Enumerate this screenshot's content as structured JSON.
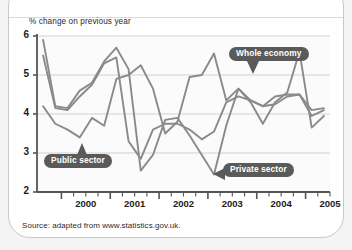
{
  "figure": {
    "axis_caption": "% change on previous year",
    "source_note": "Source: adapted from www.statistics.gov.uk.",
    "callouts": {
      "whole_economy": "Whole economy",
      "public_sector": "Public sector",
      "private_sector": "Private sector"
    }
  },
  "chart_data": {
    "type": "line",
    "title": "",
    "subtitle": "",
    "xlabel": "",
    "ylabel": "% change on previous year",
    "xlim": [
      1999.5,
      2005.5
    ],
    "ylim": [
      2,
      6
    ],
    "yticks": [
      2,
      3,
      4,
      5,
      6
    ],
    "ytick_labels": [
      "2",
      "3",
      "4",
      "5",
      "6"
    ],
    "xticks": [
      2000,
      2001,
      2002,
      2003,
      2004,
      2005
    ],
    "xtick_labels": [
      "2000",
      "2001",
      "2002",
      "2003",
      "2004",
      "2005"
    ],
    "minor_xticks_per_year": 4,
    "grid": "horizontal",
    "legend": "inline-callouts",
    "line_color": "#8a8a8a",
    "grid_color": "#cccccc",
    "axis_color": "#555555",
    "x": [
      1999.625,
      1999.875,
      2000.125,
      2000.375,
      2000.625,
      2000.875,
      2001.125,
      2001.375,
      2001.625,
      2001.875,
      2002.125,
      2002.375,
      2002.625,
      2002.875,
      2003.125,
      2003.375,
      2003.625,
      2003.875,
      2004.125,
      2004.375,
      2004.625,
      2004.875,
      2005.125,
      2005.375
    ],
    "series": [
      {
        "name": "Whole economy",
        "values": [
          5.5,
          4.15,
          4.1,
          4.45,
          4.75,
          5.3,
          5.45,
          3.3,
          2.85,
          3.6,
          3.75,
          3.75,
          3.6,
          3.35,
          3.55,
          4.3,
          4.45,
          4.35,
          4.2,
          4.45,
          4.5,
          4.5,
          3.95,
          4.1
        ]
      },
      {
        "name": "Public sector",
        "values": [
          4.2,
          3.75,
          3.6,
          3.4,
          3.9,
          3.7,
          4.9,
          5.0,
          5.25,
          4.65,
          3.5,
          3.8,
          4.95,
          5.0,
          5.55,
          4.35,
          4.65,
          4.3,
          3.75,
          4.3,
          4.55,
          5.6,
          3.65,
          3.95
        ]
      },
      {
        "name": "Private sector",
        "values": [
          5.9,
          4.2,
          4.15,
          4.6,
          4.8,
          5.35,
          5.7,
          5.15,
          2.55,
          2.95,
          3.85,
          3.9,
          3.45,
          2.95,
          2.45,
          3.7,
          4.65,
          4.35,
          4.2,
          4.25,
          4.45,
          4.5,
          4.1,
          4.15
        ]
      }
    ]
  }
}
